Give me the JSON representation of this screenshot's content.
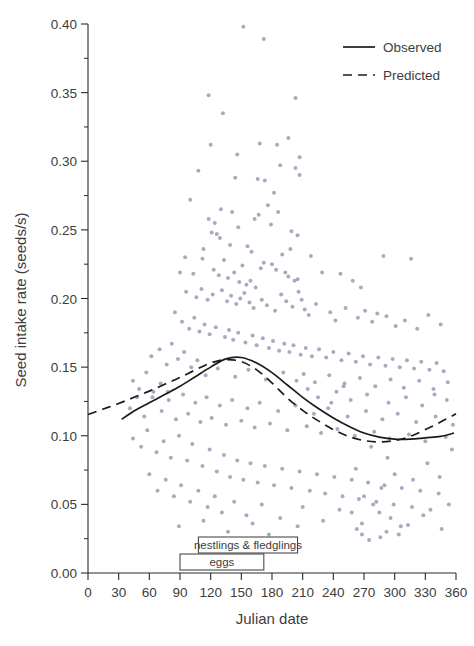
{
  "chart_data": {
    "type": "scatter",
    "title": "",
    "xlabel": "Julian date",
    "ylabel": "Seed intake rate (seeds/s)",
    "xlim": [
      0,
      360
    ],
    "ylim": [
      0.0,
      0.4
    ],
    "xticks": [
      "0",
      "30",
      "60",
      "90",
      "120",
      "150",
      "180",
      "210",
      "240",
      "270",
      "300",
      "330",
      "360"
    ],
    "xtick_values": [
      0,
      30,
      60,
      90,
      120,
      150,
      180,
      210,
      240,
      270,
      300,
      330,
      360
    ],
    "yticks": [
      "0.00",
      "0.05",
      "0.10",
      "0.15",
      "0.20",
      "0.25",
      "0.30",
      "0.35",
      "0.40"
    ],
    "ytick_values": [
      0.0,
      0.05,
      0.1,
      0.15,
      0.2,
      0.25,
      0.3,
      0.35,
      0.4
    ],
    "minor_ticks": true,
    "grid": false,
    "legend_position": "top-right",
    "point_color": "#a9a9c2",
    "point_size": 2.0,
    "line_color": "#1b1b1b",
    "legend": [
      {
        "label": "Observed",
        "style": "solid"
      },
      {
        "label": "Predicted",
        "style": "dashed"
      }
    ],
    "series": [
      {
        "name": "Observed",
        "style": "solid",
        "x": [
          33,
          45,
          60,
          75,
          90,
          105,
          120,
          135,
          150,
          165,
          180,
          195,
          210,
          225,
          240,
          255,
          270,
          285,
          300,
          315,
          330,
          345,
          358
        ],
        "y": [
          0.112,
          0.118,
          0.124,
          0.13,
          0.136,
          0.143,
          0.15,
          0.156,
          0.157,
          0.153,
          0.146,
          0.137,
          0.128,
          0.12,
          0.113,
          0.107,
          0.102,
          0.099,
          0.0975,
          0.0975,
          0.0985,
          0.0995,
          0.102
        ]
      },
      {
        "name": "Predicted",
        "style": "dashed",
        "x": [
          0,
          15,
          30,
          45,
          60,
          75,
          90,
          105,
          120,
          135,
          150,
          165,
          180,
          195,
          210,
          225,
          240,
          255,
          270,
          285,
          300,
          315,
          330,
          345,
          360
        ],
        "y": [
          0.1155,
          0.1195,
          0.1235,
          0.128,
          0.1325,
          0.1375,
          0.1425,
          0.148,
          0.153,
          0.1555,
          0.154,
          0.148,
          0.1385,
          0.1275,
          0.1185,
          0.111,
          0.1045,
          0.0995,
          0.0965,
          0.0955,
          0.0965,
          0.0995,
          0.1045,
          0.11,
          0.116
        ]
      }
    ],
    "annotations": [
      {
        "label": "nestlings & fledglings",
        "x_start": 108,
        "x_end": 205,
        "row": 0
      },
      {
        "label": "eggs",
        "x_start": 90,
        "x_end": 172,
        "row": 1
      }
    ],
    "scatter_points": [
      [
        152,
        0.398
      ],
      [
        172,
        0.389
      ],
      [
        203,
        0.346
      ],
      [
        118,
        0.348
      ],
      [
        196,
        0.317
      ],
      [
        132,
        0.335
      ],
      [
        146,
        0.305
      ],
      [
        207,
        0.303
      ],
      [
        120,
        0.312
      ],
      [
        168,
        0.313
      ],
      [
        185,
        0.312
      ],
      [
        203,
        0.295
      ],
      [
        188,
        0.297
      ],
      [
        207,
        0.29
      ],
      [
        108,
        0.293
      ],
      [
        144,
        0.288
      ],
      [
        166,
        0.287
      ],
      [
        173,
        0.286
      ],
      [
        182,
        0.277
      ],
      [
        100,
        0.272
      ],
      [
        130,
        0.265
      ],
      [
        141,
        0.263
      ],
      [
        176,
        0.268
      ],
      [
        186,
        0.263
      ],
      [
        118,
        0.258
      ],
      [
        124,
        0.255
      ],
      [
        147,
        0.252
      ],
      [
        163,
        0.258
      ],
      [
        167,
        0.261
      ],
      [
        179,
        0.254
      ],
      [
        199,
        0.249
      ],
      [
        205,
        0.246
      ],
      [
        121,
        0.248
      ],
      [
        126,
        0.247
      ],
      [
        129,
        0.244
      ],
      [
        113,
        0.236
      ],
      [
        139,
        0.239
      ],
      [
        156,
        0.238
      ],
      [
        160,
        0.234
      ],
      [
        190,
        0.232
      ],
      [
        198,
        0.236
      ],
      [
        218,
        0.231
      ],
      [
        95,
        0.23
      ],
      [
        112,
        0.229
      ],
      [
        133,
        0.228
      ],
      [
        151,
        0.224
      ],
      [
        169,
        0.222
      ],
      [
        172,
        0.226
      ],
      [
        180,
        0.225
      ],
      [
        184,
        0.221
      ],
      [
        193,
        0.219
      ],
      [
        196,
        0.216
      ],
      [
        202,
        0.213
      ],
      [
        205,
        0.214
      ],
      [
        90,
        0.219
      ],
      [
        103,
        0.218
      ],
      [
        123,
        0.221
      ],
      [
        128,
        0.217
      ],
      [
        137,
        0.215
      ],
      [
        143,
        0.219
      ],
      [
        148,
        0.212
      ],
      [
        155,
        0.21
      ],
      [
        159,
        0.213
      ],
      [
        164,
        0.208
      ],
      [
        229,
        0.219
      ],
      [
        247,
        0.218
      ],
      [
        259,
        0.213
      ],
      [
        267,
        0.208
      ],
      [
        289,
        0.231
      ],
      [
        316,
        0.229
      ],
      [
        96,
        0.205
      ],
      [
        106,
        0.201
      ],
      [
        111,
        0.207
      ],
      [
        117,
        0.199
      ],
      [
        122,
        0.203
      ],
      [
        131,
        0.206
      ],
      [
        136,
        0.198
      ],
      [
        140,
        0.202
      ],
      [
        145,
        0.196
      ],
      [
        149,
        0.2
      ],
      [
        153,
        0.204
      ],
      [
        158,
        0.197
      ],
      [
        162,
        0.193
      ],
      [
        170,
        0.199
      ],
      [
        175,
        0.195
      ],
      [
        183,
        0.191
      ],
      [
        189,
        0.203
      ],
      [
        194,
        0.198
      ],
      [
        200,
        0.194
      ],
      [
        206,
        0.205
      ],
      [
        209,
        0.199
      ],
      [
        212,
        0.192
      ],
      [
        216,
        0.188
      ],
      [
        223,
        0.196
      ],
      [
        237,
        0.19
      ],
      [
        242,
        0.184
      ],
      [
        252,
        0.193
      ],
      [
        264,
        0.186
      ],
      [
        271,
        0.191
      ],
      [
        278,
        0.183
      ],
      [
        283,
        0.189
      ],
      [
        292,
        0.187
      ],
      [
        301,
        0.18
      ],
      [
        310,
        0.184
      ],
      [
        322,
        0.178
      ],
      [
        333,
        0.188
      ],
      [
        345,
        0.181
      ],
      [
        85,
        0.19
      ],
      [
        92,
        0.183
      ],
      [
        99,
        0.178
      ],
      [
        104,
        0.186
      ],
      [
        109,
        0.176
      ],
      [
        114,
        0.181
      ],
      [
        119,
        0.174
      ],
      [
        125,
        0.179
      ],
      [
        134,
        0.172
      ],
      [
        138,
        0.177
      ],
      [
        142,
        0.17
      ],
      [
        147,
        0.175
      ],
      [
        154,
        0.168
      ],
      [
        161,
        0.173
      ],
      [
        165,
        0.166
      ],
      [
        171,
        0.171
      ],
      [
        177,
        0.164
      ],
      [
        181,
        0.169
      ],
      [
        187,
        0.162
      ],
      [
        192,
        0.167
      ],
      [
        197,
        0.161
      ],
      [
        201,
        0.166
      ],
      [
        208,
        0.159
      ],
      [
        213,
        0.164
      ],
      [
        219,
        0.158
      ],
      [
        226,
        0.163
      ],
      [
        233,
        0.157
      ],
      [
        240,
        0.161
      ],
      [
        248,
        0.155
      ],
      [
        255,
        0.16
      ],
      [
        262,
        0.154
      ],
      [
        269,
        0.158
      ],
      [
        276,
        0.152
      ],
      [
        284,
        0.157
      ],
      [
        291,
        0.151
      ],
      [
        298,
        0.156
      ],
      [
        305,
        0.15
      ],
      [
        312,
        0.155
      ],
      [
        319,
        0.149
      ],
      [
        326,
        0.154
      ],
      [
        334,
        0.148
      ],
      [
        341,
        0.153
      ],
      [
        348,
        0.147
      ],
      [
        62,
        0.158
      ],
      [
        70,
        0.163
      ],
      [
        77,
        0.152
      ],
      [
        82,
        0.167
      ],
      [
        88,
        0.156
      ],
      [
        94,
        0.161
      ],
      [
        101,
        0.15
      ],
      [
        107,
        0.155
      ],
      [
        115,
        0.144
      ],
      [
        127,
        0.149
      ],
      [
        144,
        0.143
      ],
      [
        157,
        0.148
      ],
      [
        174,
        0.141
      ],
      [
        191,
        0.146
      ],
      [
        204,
        0.14
      ],
      [
        211,
        0.145
      ],
      [
        222,
        0.139
      ],
      [
        236,
        0.144
      ],
      [
        251,
        0.138
      ],
      [
        266,
        0.142
      ],
      [
        281,
        0.136
      ],
      [
        296,
        0.141
      ],
      [
        309,
        0.135
      ],
      [
        324,
        0.14
      ],
      [
        338,
        0.134
      ],
      [
        352,
        0.139
      ],
      [
        41,
        0.12
      ],
      [
        48,
        0.128
      ],
      [
        55,
        0.114
      ],
      [
        64,
        0.132
      ],
      [
        72,
        0.118
      ],
      [
        79,
        0.126
      ],
      [
        86,
        0.112
      ],
      [
        93,
        0.13
      ],
      [
        98,
        0.116
      ],
      [
        105,
        0.124
      ],
      [
        110,
        0.11
      ],
      [
        116,
        0.128
      ],
      [
        121,
        0.113
      ],
      [
        129,
        0.122
      ],
      [
        135,
        0.108
      ],
      [
        141,
        0.126
      ],
      [
        150,
        0.111
      ],
      [
        156,
        0.12
      ],
      [
        163,
        0.106
      ],
      [
        168,
        0.124
      ],
      [
        178,
        0.109
      ],
      [
        186,
        0.118
      ],
      [
        195,
        0.104
      ],
      [
        203,
        0.122
      ],
      [
        214,
        0.107
      ],
      [
        221,
        0.116
      ],
      [
        228,
        0.102
      ],
      [
        235,
        0.12
      ],
      [
        244,
        0.105
      ],
      [
        254,
        0.114
      ],
      [
        261,
        0.1
      ],
      [
        272,
        0.118
      ],
      [
        280,
        0.103
      ],
      [
        288,
        0.112
      ],
      [
        295,
        0.098
      ],
      [
        303,
        0.116
      ],
      [
        314,
        0.101
      ],
      [
        321,
        0.11
      ],
      [
        330,
        0.096
      ],
      [
        340,
        0.114
      ],
      [
        350,
        0.099
      ],
      [
        357,
        0.108
      ],
      [
        44,
        0.098
      ],
      [
        52,
        0.092
      ],
      [
        58,
        0.104
      ],
      [
        67,
        0.088
      ],
      [
        74,
        0.096
      ],
      [
        81,
        0.084
      ],
      [
        89,
        0.1
      ],
      [
        97,
        0.082
      ],
      [
        102,
        0.094
      ],
      [
        112,
        0.078
      ],
      [
        119,
        0.09
      ],
      [
        126,
        0.074
      ],
      [
        133,
        0.086
      ],
      [
        139,
        0.07
      ],
      [
        146,
        0.082
      ],
      [
        152,
        0.068
      ],
      [
        159,
        0.08
      ],
      [
        166,
        0.066
      ],
      [
        173,
        0.078
      ],
      [
        182,
        0.064
      ],
      [
        190,
        0.076
      ],
      [
        199,
        0.062
      ],
      [
        207,
        0.074
      ],
      [
        217,
        0.06
      ],
      [
        224,
        0.072
      ],
      [
        232,
        0.058
      ],
      [
        241,
        0.07
      ],
      [
        249,
        0.056
      ],
      [
        258,
        0.068
      ],
      [
        265,
        0.054
      ],
      [
        274,
        0.066
      ],
      [
        282,
        0.052
      ],
      [
        290,
        0.064
      ],
      [
        299,
        0.05
      ],
      [
        307,
        0.062
      ],
      [
        317,
        0.048
      ],
      [
        325,
        0.06
      ],
      [
        335,
        0.046
      ],
      [
        343,
        0.058
      ],
      [
        353,
        0.05
      ],
      [
        60,
        0.072
      ],
      [
        68,
        0.06
      ],
      [
        76,
        0.068
      ],
      [
        84,
        0.056
      ],
      [
        91,
        0.064
      ],
      [
        100,
        0.052
      ],
      [
        108,
        0.06
      ],
      [
        117,
        0.048
      ],
      [
        124,
        0.056
      ],
      [
        131,
        0.044
      ],
      [
        143,
        0.052
      ],
      [
        155,
        0.042
      ],
      [
        170,
        0.05
      ],
      [
        188,
        0.04
      ],
      [
        210,
        0.048
      ],
      [
        230,
        0.038
      ],
      [
        246,
        0.046
      ],
      [
        268,
        0.036
      ],
      [
        285,
        0.044
      ],
      [
        306,
        0.034
      ],
      [
        328,
        0.042
      ],
      [
        346,
        0.032
      ],
      [
        268,
        0.028
      ],
      [
        292,
        0.03
      ],
      [
        275,
        0.024
      ],
      [
        263,
        0.032
      ],
      [
        286,
        0.026
      ],
      [
        304,
        0.028
      ],
      [
        313,
        0.035
      ],
      [
        296,
        0.04
      ],
      [
        258,
        0.044
      ],
      [
        279,
        0.05
      ],
      [
        270,
        0.056
      ],
      [
        287,
        0.062
      ],
      [
        262,
        0.076
      ],
      [
        293,
        0.084
      ],
      [
        277,
        0.092
      ],
      [
        300,
        0.072
      ],
      [
        318,
        0.068
      ],
      [
        332,
        0.08
      ],
      [
        344,
        0.07
      ],
      [
        356,
        0.09
      ],
      [
        89,
        0.034
      ],
      [
        113,
        0.038
      ],
      [
        137,
        0.03
      ],
      [
        161,
        0.036
      ],
      [
        177,
        0.028
      ],
      [
        205,
        0.034
      ],
      [
        44,
        0.14
      ],
      [
        50,
        0.134
      ],
      [
        57,
        0.146
      ],
      [
        63,
        0.128
      ],
      [
        71,
        0.138
      ],
      [
        78,
        0.132
      ],
      [
        225,
        0.128
      ],
      [
        243,
        0.132
      ],
      [
        257,
        0.126
      ],
      [
        273,
        0.13
      ],
      [
        294,
        0.124
      ],
      [
        311,
        0.128
      ],
      [
        327,
        0.122
      ],
      [
        339,
        0.13
      ],
      [
        351,
        0.126
      ],
      [
        215,
        0.134
      ],
      [
        238,
        0.124
      ],
      [
        250,
        0.136
      ]
    ]
  },
  "legend": {
    "observed": "Observed",
    "predicted": "Predicted"
  },
  "caption": ""
}
